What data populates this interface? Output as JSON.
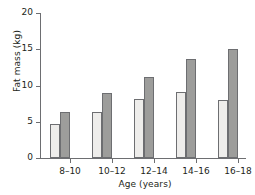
{
  "chart_data": {
    "type": "bar",
    "title": "",
    "xlabel": "Age (years)",
    "ylabel": "Fat mass (kg)",
    "categories": [
      "8–10",
      "10–12",
      "12–14",
      "14–16",
      "16–18"
    ],
    "series": [
      {
        "name": "light",
        "values": [
          4.7,
          6.4,
          8.2,
          9.1,
          8.0
        ]
      },
      {
        "name": "dark",
        "values": [
          6.4,
          8.9,
          11.2,
          13.6,
          15.1
        ]
      }
    ],
    "ylim": [
      0,
      20
    ],
    "yticks": [
      0,
      5,
      10,
      15,
      20
    ],
    "ytick_labels": [
      "0",
      "5",
      "10",
      "15",
      "20"
    ],
    "grid": false,
    "legend": "none",
    "colors": {
      "light_bar_fill": "#eeedeb",
      "dark_bar_fill": "#9d9d9b",
      "bar_edge": "#6d6e71",
      "axis": "#6d6e71",
      "text": "#231f20",
      "background": "#ffffff"
    }
  }
}
